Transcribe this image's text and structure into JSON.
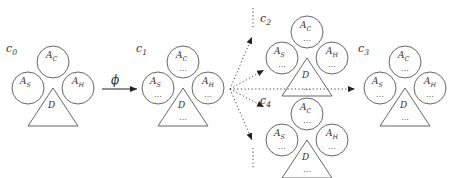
{
  "diagram": {
    "type": "state-transition",
    "transition_label": "ϕ",
    "continuation_mark": "⋮",
    "ellipsis_mark": "…",
    "configurations": [
      {
        "id": "c0",
        "label": "c",
        "sub": "0",
        "x": 8,
        "y": 40,
        "has_content": false
      },
      {
        "id": "c1",
        "label": "c",
        "sub": "1",
        "x": 138,
        "y": 40,
        "has_content": true
      },
      {
        "id": "c2",
        "label": "c",
        "sub": "2",
        "x": 262,
        "y": 10,
        "has_content": true
      },
      {
        "id": "c3",
        "label": "c",
        "sub": "3",
        "x": 360,
        "y": 40,
        "has_content": true
      },
      {
        "id": "c4",
        "label": "c",
        "sub": "4",
        "x": 262,
        "y": 92,
        "has_content": true
      }
    ],
    "nodes": {
      "top_circle": {
        "label": "A",
        "sub": "C"
      },
      "left_circle": {
        "label": "A",
        "sub": "S"
      },
      "right_circle": {
        "label": "A",
        "sub": "H"
      },
      "triangle": {
        "label": "D"
      }
    },
    "colors": {
      "stroke": "#555555",
      "text": "#333333",
      "background": "#ffffff"
    }
  }
}
